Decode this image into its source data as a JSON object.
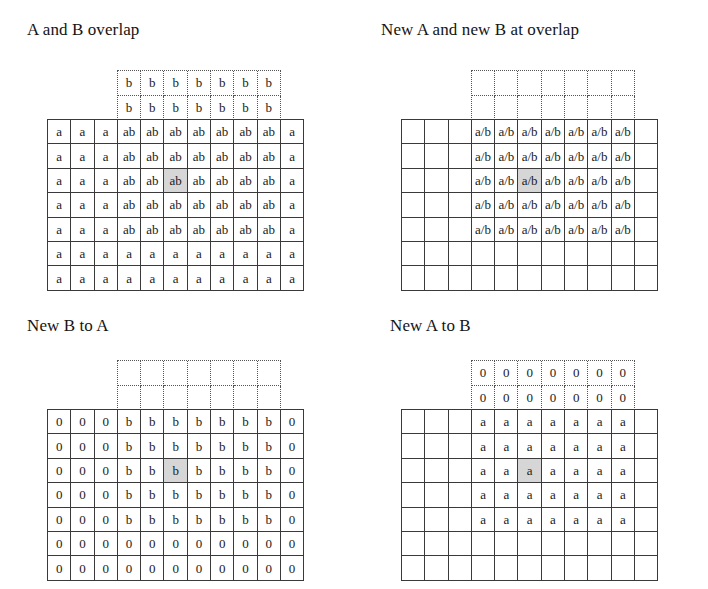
{
  "figure": {
    "background_color": "#ffffff",
    "line_color": "#3a3a3a",
    "dotted_line_color": "#555555",
    "highlight_color": "#d6d6d6"
  },
  "grid_geometry": {
    "solid_columns": 11,
    "solid_rows": 7,
    "dotted_columns": 7,
    "dotted_rows": 7,
    "dotted_col_offset": 3,
    "dotted_row_offset": -2,
    "highlight_col": 5,
    "highlight_row": 2,
    "cell_width_px": 23.3,
    "cell_height_px": 24.4
  },
  "panels": [
    {
      "id": "a-and-b-overlap",
      "title": "A and B overlap",
      "title_left": 27,
      "title_top": 20,
      "grid_left": 47,
      "grid_top": 119,
      "solid_rows": [
        [
          "a",
          "a",
          "a",
          "ab",
          "ab",
          "ab",
          "ab",
          "ab",
          "ab",
          "ab",
          "a"
        ],
        [
          "a",
          "a",
          "a",
          "ab",
          "ab",
          "ab",
          "ab",
          "ab",
          "ab",
          "ab",
          "a"
        ],
        [
          "a",
          "a",
          "a",
          "ab",
          "ab",
          "ab",
          "ab",
          "ab",
          "ab",
          "ab",
          "a"
        ],
        [
          "a",
          "a",
          "a",
          "ab",
          "ab",
          "ab",
          "ab",
          "ab",
          "ab",
          "ab",
          "a"
        ],
        [
          "a",
          "a",
          "a",
          "ab",
          "ab",
          "ab",
          "ab",
          "ab",
          "ab",
          "ab",
          "a"
        ],
        [
          "a",
          "a",
          "a",
          "a",
          "a",
          "a",
          "a",
          "a",
          "a",
          "a",
          "a"
        ],
        [
          "a",
          "a",
          "a",
          "a",
          "a",
          "a",
          "a",
          "a",
          "a",
          "a",
          "a"
        ]
      ],
      "dotted_rows": [
        [
          "b",
          "b",
          "b",
          "b",
          "b",
          "b",
          "b"
        ],
        [
          "b",
          "b",
          "b",
          "b",
          "b",
          "b",
          "b"
        ],
        [
          "",
          "",
          "",
          "",
          "",
          "",
          ""
        ],
        [
          "",
          "",
          "",
          "",
          "",
          "",
          ""
        ],
        [
          "",
          "",
          "",
          "",
          "",
          "",
          ""
        ],
        [
          "",
          "",
          "",
          "",
          "",
          "",
          ""
        ],
        [
          "",
          "",
          "",
          "",
          "",
          "",
          ""
        ]
      ]
    },
    {
      "id": "new-a-and-new-b-at-overlap",
      "title": "New A and new B at overlap",
      "title_left": 381,
      "title_top": 20,
      "grid_left": 401,
      "grid_top": 119,
      "solid_rows": [
        [
          "",
          "",
          "",
          "a/b",
          "a/b",
          "a/b",
          "a/b",
          "a/b",
          "a/b",
          "a/b",
          ""
        ],
        [
          "",
          "",
          "",
          "a/b",
          "a/b",
          "a/b",
          "a/b",
          "a/b",
          "a/b",
          "a/b",
          ""
        ],
        [
          "",
          "",
          "",
          "a/b",
          "a/b",
          "a/b",
          "a/b",
          "a/b",
          "a/b",
          "a/b",
          ""
        ],
        [
          "",
          "",
          "",
          "a/b",
          "a/b",
          "a/b",
          "a/b",
          "a/b",
          "a/b",
          "a/b",
          ""
        ],
        [
          "",
          "",
          "",
          "a/b",
          "a/b",
          "a/b",
          "a/b",
          "a/b",
          "a/b",
          "a/b",
          ""
        ],
        [
          "",
          "",
          "",
          "",
          "",
          "",
          "",
          "",
          "",
          "",
          ""
        ],
        [
          "",
          "",
          "",
          "",
          "",
          "",
          "",
          "",
          "",
          "",
          ""
        ]
      ],
      "dotted_rows": [
        [
          "",
          "",
          "",
          "",
          "",
          "",
          ""
        ],
        [
          "",
          "",
          "",
          "",
          "",
          "",
          ""
        ],
        [
          "",
          "",
          "",
          "",
          "",
          "",
          ""
        ],
        [
          "",
          "",
          "",
          "",
          "",
          "",
          ""
        ],
        [
          "",
          "",
          "",
          "",
          "",
          "",
          ""
        ],
        [
          "",
          "",
          "",
          "",
          "",
          "",
          ""
        ],
        [
          "",
          "",
          "",
          "",
          "",
          "",
          ""
        ]
      ]
    },
    {
      "id": "new-b-to-a",
      "title": "New B to A",
      "title_left": 27,
      "title_top": 316,
      "grid_left": 47,
      "grid_top": 409,
      "solid_rows": [
        [
          "0",
          "0",
          "0",
          "b",
          "b",
          "b",
          "b",
          "b",
          "b",
          "b",
          "0"
        ],
        [
          "0",
          "0",
          "0",
          "b",
          "b",
          "b",
          "b",
          "b",
          "b",
          "b",
          "0"
        ],
        [
          "0",
          "0",
          "0",
          "b",
          "b",
          "b",
          "b",
          "b",
          "b",
          "b",
          "0"
        ],
        [
          "0",
          "0",
          "0",
          "b",
          "b",
          "b",
          "b",
          "b",
          "b",
          "b",
          "0"
        ],
        [
          "0",
          "0",
          "0",
          "b",
          "b",
          "b",
          "b",
          "b",
          "b",
          "b",
          "0"
        ],
        [
          "0",
          "0",
          "0",
          "0",
          "0",
          "0",
          "0",
          "0",
          "0",
          "0",
          "0"
        ],
        [
          "0",
          "0",
          "0",
          "0",
          "0",
          "0",
          "0",
          "0",
          "0",
          "0",
          "0"
        ]
      ],
      "dotted_rows": [
        [
          "",
          "",
          "",
          "",
          "",
          "",
          ""
        ],
        [
          "",
          "",
          "",
          "",
          "",
          "",
          ""
        ],
        [
          "",
          "",
          "",
          "",
          "",
          "",
          ""
        ],
        [
          "",
          "",
          "",
          "",
          "",
          "",
          ""
        ],
        [
          "",
          "",
          "",
          "",
          "",
          "",
          ""
        ],
        [
          "",
          "",
          "",
          "",
          "",
          "",
          ""
        ],
        [
          "",
          "",
          "",
          "",
          "",
          "",
          ""
        ]
      ]
    },
    {
      "id": "new-a-to-b",
      "title": "New A to B",
      "title_left": 390,
      "title_top": 316,
      "grid_left": 401,
      "grid_top": 409,
      "solid_rows": [
        [
          "",
          "",
          "",
          "a",
          "a",
          "a",
          "a",
          "a",
          "a",
          "a",
          ""
        ],
        [
          "",
          "",
          "",
          "a",
          "a",
          "a",
          "a",
          "a",
          "a",
          "a",
          ""
        ],
        [
          "",
          "",
          "",
          "a",
          "a",
          "a",
          "a",
          "a",
          "a",
          "a",
          ""
        ],
        [
          "",
          "",
          "",
          "a",
          "a",
          "a",
          "a",
          "a",
          "a",
          "a",
          ""
        ],
        [
          "",
          "",
          "",
          "a",
          "a",
          "a",
          "a",
          "a",
          "a",
          "a",
          ""
        ],
        [
          "",
          "",
          "",
          "",
          "",
          "",
          "",
          "",
          "",
          "",
          ""
        ],
        [
          "",
          "",
          "",
          "",
          "",
          "",
          "",
          "",
          "",
          "",
          ""
        ]
      ],
      "dotted_rows": [
        [
          "0",
          "0",
          "0",
          "0",
          "0",
          "0",
          "0"
        ],
        [
          "0",
          "0",
          "0",
          "0",
          "0",
          "0",
          "0"
        ],
        [
          "",
          "",
          "",
          "",
          "",
          "",
          ""
        ],
        [
          "",
          "",
          "",
          "",
          "",
          "",
          ""
        ],
        [
          "",
          "",
          "",
          "",
          "",
          "",
          ""
        ],
        [
          "",
          "",
          "",
          "",
          "",
          "",
          ""
        ],
        [
          "",
          "",
          "",
          "",
          "",
          "",
          ""
        ]
      ]
    }
  ]
}
